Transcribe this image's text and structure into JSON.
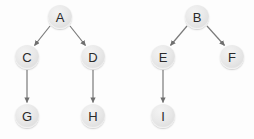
{
  "diagram": {
    "background_color": "#fdfdfd",
    "node_fill_color": "#e6e6e6",
    "node_text_color": "#2a2a2a",
    "edge_color": "#7a7a7a",
    "node_diameter": 24
  },
  "trees": [
    {
      "name": "left-tree",
      "root": "A",
      "nodes": [
        {
          "id": "node-a",
          "label": "A",
          "x": 60,
          "y": 17
        },
        {
          "id": "node-c",
          "label": "C",
          "x": 27,
          "y": 57
        },
        {
          "id": "node-d",
          "label": "D",
          "x": 93,
          "y": 57
        },
        {
          "id": "node-g",
          "label": "G",
          "x": 27,
          "y": 116
        },
        {
          "id": "node-h",
          "label": "H",
          "x": 93,
          "y": 116
        }
      ],
      "edges": [
        {
          "from": "A",
          "to": "C",
          "x1": 50,
          "y1": 26,
          "x2": 34,
          "y2": 46
        },
        {
          "from": "A",
          "to": "D",
          "x1": 70,
          "y1": 26,
          "x2": 86,
          "y2": 46
        },
        {
          "from": "C",
          "to": "G",
          "x1": 27,
          "y1": 70,
          "x2": 27,
          "y2": 103
        },
        {
          "from": "D",
          "to": "H",
          "x1": 93,
          "y1": 70,
          "x2": 93,
          "y2": 103
        }
      ]
    },
    {
      "name": "right-tree",
      "root": "B",
      "nodes": [
        {
          "id": "node-b",
          "label": "B",
          "x": 197,
          "y": 17
        },
        {
          "id": "node-e",
          "label": "E",
          "x": 163,
          "y": 57
        },
        {
          "id": "node-f",
          "label": "F",
          "x": 232,
          "y": 57
        },
        {
          "id": "node-i",
          "label": "I",
          "x": 163,
          "y": 116
        }
      ],
      "edges": [
        {
          "from": "B",
          "to": "E",
          "x1": 187,
          "y1": 26,
          "x2": 170,
          "y2": 46
        },
        {
          "from": "B",
          "to": "F",
          "x1": 207,
          "y1": 26,
          "x2": 225,
          "y2": 46
        },
        {
          "from": "E",
          "to": "I",
          "x1": 163,
          "y1": 70,
          "x2": 163,
          "y2": 103
        }
      ]
    }
  ],
  "labels": {
    "a": "A",
    "b": "B",
    "c": "C",
    "d": "D",
    "e": "E",
    "f": "F",
    "g": "G",
    "h": "H",
    "i": "I"
  }
}
